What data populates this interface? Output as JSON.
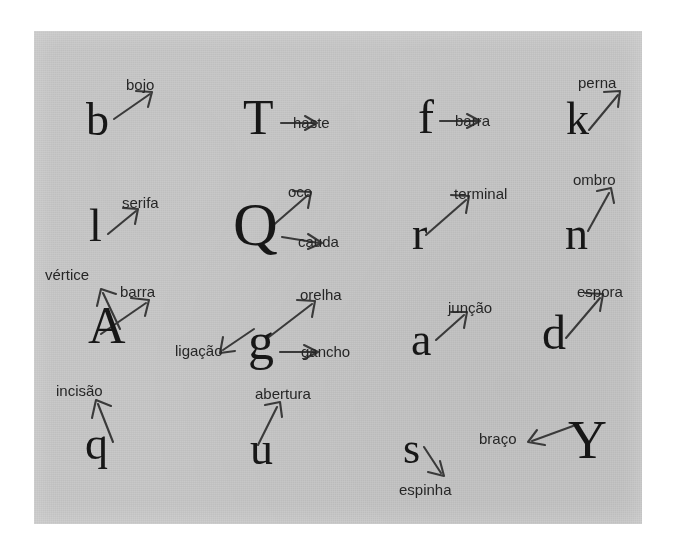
{
  "figure": {
    "kind": "typographic-anatomy-plate",
    "language": "pt-BR",
    "background_color": "#ffffff",
    "plate_color": "#c9c9c9",
    "ink_color": "#171717",
    "label_color": "#262626",
    "arrow_color": "#3a3a3a"
  },
  "annotations": [
    {
      "id": "bojo",
      "glyph": "b",
      "label": "bojo",
      "arrow": "up-right"
    },
    {
      "id": "haste",
      "glyph": "T",
      "label": "haste",
      "arrow": "right"
    },
    {
      "id": "barra-f",
      "glyph": "f",
      "label": "barra",
      "arrow": "right"
    },
    {
      "id": "perna",
      "glyph": "k",
      "label": "perna",
      "arrow": "up-right"
    },
    {
      "id": "serifa",
      "glyph": "l",
      "label": "serifa",
      "arrow": "up-right"
    },
    {
      "id": "oco",
      "glyph": "Q",
      "label": "oco",
      "arrow": "up-right"
    },
    {
      "id": "cauda",
      "glyph": "Q",
      "label": "cauda",
      "arrow": "right"
    },
    {
      "id": "terminal",
      "glyph": "r",
      "label": "terminal",
      "arrow": "up-right"
    },
    {
      "id": "ombro",
      "glyph": "n",
      "label": "ombro",
      "arrow": "up-right"
    },
    {
      "id": "vertice",
      "glyph": "A",
      "label": "vértice",
      "arrow": "up-left"
    },
    {
      "id": "barra-a",
      "glyph": "A",
      "label": "barra",
      "arrow": "up-right"
    },
    {
      "id": "orelha",
      "glyph": "g",
      "label": "orelha",
      "arrow": "up-right"
    },
    {
      "id": "ligacao",
      "glyph": "g",
      "label": "ligação",
      "arrow": "down-left"
    },
    {
      "id": "gancho",
      "glyph": "g",
      "label": "gancho",
      "arrow": "right"
    },
    {
      "id": "juncao",
      "glyph": "a",
      "label": "junção",
      "arrow": "up-right"
    },
    {
      "id": "espora",
      "glyph": "d",
      "label": "espora",
      "arrow": "up-right"
    },
    {
      "id": "incisao",
      "glyph": "q",
      "label": "incisão",
      "arrow": "up-left"
    },
    {
      "id": "abertura",
      "glyph": "u",
      "label": "abertura",
      "arrow": "up-right"
    },
    {
      "id": "espinha",
      "glyph": "s",
      "label": "espinha",
      "arrow": "down-right"
    },
    {
      "id": "braco",
      "glyph": "Y",
      "label": "braço",
      "arrow": "left"
    }
  ],
  "glyphs": {
    "b": "b",
    "T": "T",
    "f": "f",
    "k": "k",
    "l": "l",
    "Q": "Q",
    "r": "r",
    "n": "n",
    "A": "A",
    "g": "g",
    "a": "a",
    "d": "d",
    "q": "q",
    "u": "u",
    "s": "s",
    "Y": "Y"
  },
  "labels": {
    "bojo": "bojo",
    "haste": "haste",
    "barra_f": "barra",
    "perna": "perna",
    "serifa": "serifa",
    "oco": "oco",
    "cauda": "cauda",
    "terminal": "terminal",
    "ombro": "ombro",
    "vertice": "vértice",
    "barra_a": "barra",
    "orelha": "orelha",
    "ligacao": "ligação",
    "gancho": "gancho",
    "juncao": "junção",
    "espora": "espora",
    "incisao": "incisão",
    "abertura": "abertura",
    "espinha": "espinha",
    "braco": "braço"
  }
}
